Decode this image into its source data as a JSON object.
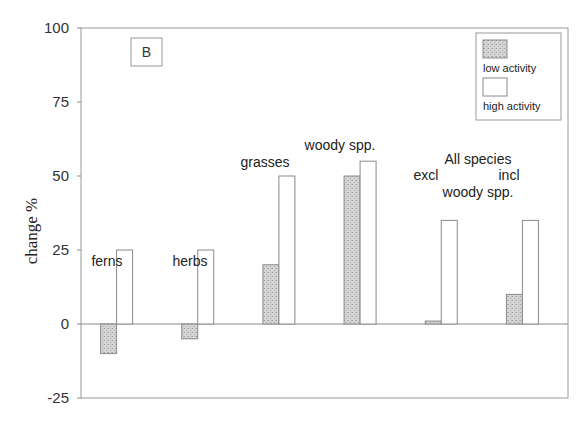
{
  "chart_data": {
    "type": "bar",
    "title": "",
    "panel_label": "B",
    "xlabel": "",
    "ylabel": "change %",
    "ylim": [
      -25,
      100
    ],
    "yticks": [
      -25,
      0,
      25,
      50,
      75,
      100
    ],
    "grid": false,
    "legend_position": "top-right",
    "categories": [
      "ferns",
      "herbs",
      "grasses",
      "woody spp.",
      "excl woody spp.",
      "incl woody spp."
    ],
    "category_labels": [
      [
        "ferns"
      ],
      [
        "herbs"
      ],
      [
        "grasses"
      ],
      [
        "woody spp."
      ],
      [
        "excl"
      ],
      [
        "incl"
      ]
    ],
    "group_annotation": [
      "All species",
      "woody spp."
    ],
    "series": [
      {
        "name": "low activity",
        "pattern": "stippled",
        "color": "#c8c8c8",
        "values": [
          -10,
          -5,
          20,
          50,
          1,
          10
        ]
      },
      {
        "name": "high activity",
        "pattern": "open",
        "color": "#ffffff",
        "values": [
          25,
          25,
          50,
          55,
          35,
          35
        ]
      }
    ]
  }
}
